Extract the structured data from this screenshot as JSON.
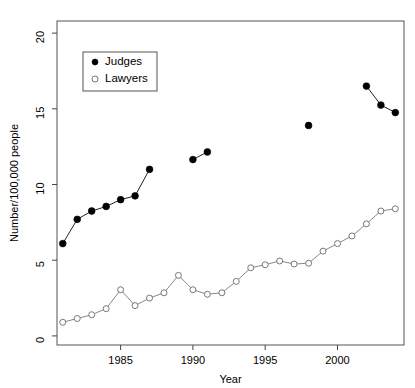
{
  "chart_data": {
    "type": "line",
    "title": "",
    "xlabel": "Year",
    "ylabel": "Number/100,000 people",
    "xlim": [
      1980.6,
      2004.6
    ],
    "ylim": [
      -0.6,
      20.8
    ],
    "xticks": [
      1985,
      1990,
      1995,
      2000
    ],
    "xtick_labels": [
      "1985",
      "1990",
      "1995",
      "2000"
    ],
    "yticks": [
      0,
      5,
      10,
      15,
      20
    ],
    "ytick_labels": [
      "0",
      "5",
      "10",
      "15",
      "20"
    ],
    "grid": false,
    "legend_position": "top-left",
    "series": [
      {
        "name": "Judges",
        "marker": "filled-circle",
        "color": "#000000",
        "segments": [
          {
            "x": [
              1981,
              1982,
              1983,
              1984,
              1985,
              1986,
              1987
            ],
            "y": [
              6.1,
              7.7,
              8.25,
              8.55,
              9.0,
              9.25,
              11.0
            ]
          },
          {
            "x": [
              1990,
              1991
            ],
            "y": [
              11.65,
              12.15
            ]
          },
          {
            "x": [
              1998
            ],
            "y": [
              13.9
            ]
          },
          {
            "x": [
              2002,
              2003,
              2004
            ],
            "y": [
              16.5,
              15.25,
              14.75
            ]
          }
        ]
      },
      {
        "name": "Lawyers",
        "marker": "open-circle",
        "color": "#777777",
        "x": [
          1981,
          1982,
          1983,
          1984,
          1985,
          1986,
          1987,
          1988,
          1989,
          1990,
          1991,
          1992,
          1993,
          1994,
          1995,
          1996,
          1997,
          1998,
          1999,
          2000,
          2001,
          2002,
          2003,
          2004
        ],
        "y": [
          0.9,
          1.15,
          1.4,
          1.8,
          3.05,
          2.0,
          2.5,
          2.85,
          4.0,
          3.05,
          2.75,
          2.85,
          3.6,
          4.5,
          4.7,
          4.95,
          4.75,
          4.8,
          5.6,
          6.1,
          6.6,
          7.4,
          8.25,
          8.4
        ]
      }
    ],
    "legend": [
      {
        "label": "Judges",
        "marker": "filled-circle"
      },
      {
        "label": "Lawyers",
        "marker": "open-circle"
      }
    ]
  }
}
